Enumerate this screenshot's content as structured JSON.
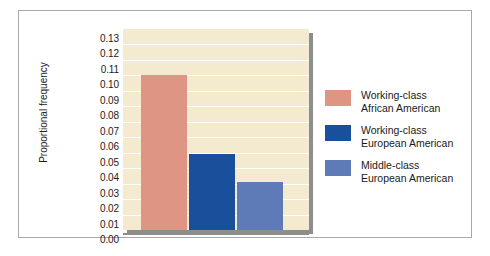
{
  "chart_data": {
    "type": "bar",
    "title": "",
    "xlabel": "",
    "ylabel": "Proportional frequency",
    "ylim": [
      0.0,
      0.13
    ],
    "ytick_step": 0.01,
    "grid": true,
    "legend_position": "right",
    "categories": [
      "Working-class African American",
      "Working-class European American",
      "Middle-class European American"
    ],
    "values": [
      0.1,
      0.049,
      0.031
    ],
    "ytick_labels": [
      "0.13",
      "0.12",
      "0.11",
      "0.10",
      "0.09",
      "0.08",
      "0.07",
      "0.06",
      "0.05",
      "0.04",
      "0.03",
      "0.02",
      "0.01",
      "0.00"
    ],
    "ytick_values": [
      0.13,
      0.12,
      0.11,
      0.1,
      0.09,
      0.08,
      0.07,
      0.06,
      0.05,
      0.04,
      0.03,
      0.02,
      0.01,
      0.0
    ],
    "colors": {
      "working_class_african_american": "#df9583",
      "working_class_european_american": "#1a4f9c",
      "middle_class_european_american": "#5e7bb8",
      "plot_background": "#f4ead0",
      "gridline": "#ffffff",
      "shadow": "#8d8d8d",
      "frame_border": "#a9a9a9",
      "text": "#1a1a1a"
    },
    "legend": [
      {
        "color": "#df9583",
        "line1": "Working-class",
        "line2": "African American"
      },
      {
        "color": "#1a4f9c",
        "line1": "Working-class",
        "line2": "European American"
      },
      {
        "color": "#5e7bb8",
        "line1": "Middle-class",
        "line2": "European American"
      }
    ]
  }
}
